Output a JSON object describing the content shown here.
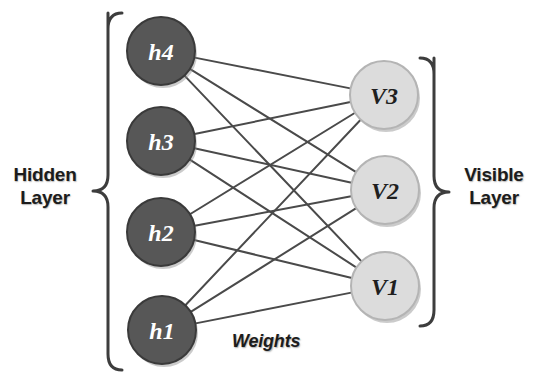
{
  "diagram": {
    "background_color": "#ffffff",
    "edge_color": "#4a4a4a",
    "edge_width": 2,
    "brace_color": "#3d3d3d"
  },
  "labels": {
    "hidden_layer": "Hidden\nLayer",
    "visible_layer": "Visible\nLayer",
    "weights": "Weights"
  },
  "hidden_layer": {
    "name": "Hidden Layer",
    "fill_color": "#575757",
    "stroke_color": "#3a3a3a",
    "text_color": "#ffffff",
    "radius": 34,
    "nodes": [
      {
        "id": "h4",
        "label": "h4",
        "cx": 161,
        "cy": 51
      },
      {
        "id": "h3",
        "label": "h3",
        "cx": 161,
        "cy": 141
      },
      {
        "id": "h2",
        "label": "h2",
        "cx": 161,
        "cy": 232
      },
      {
        "id": "h1",
        "label": "h1",
        "cx": 162,
        "cy": 330
      }
    ]
  },
  "visible_layer": {
    "name": "Visible Layer",
    "fill_color": "#dcdcdc",
    "stroke_color": "#b4b4b4",
    "text_color": "#1f1f1f",
    "radius": 34,
    "nodes": [
      {
        "id": "V3",
        "label": "V3",
        "cx": 384,
        "cy": 95
      },
      {
        "id": "V2",
        "label": "V2",
        "cx": 385,
        "cy": 190
      },
      {
        "id": "V1",
        "label": "V1",
        "cx": 385,
        "cy": 286
      }
    ]
  },
  "connections": {
    "name": "Weights",
    "description": "fully connected between every hidden node and every visible node",
    "edges": [
      {
        "from": "h4",
        "to": "V3"
      },
      {
        "from": "h4",
        "to": "V2"
      },
      {
        "from": "h4",
        "to": "V1"
      },
      {
        "from": "h3",
        "to": "V3"
      },
      {
        "from": "h3",
        "to": "V2"
      },
      {
        "from": "h3",
        "to": "V1"
      },
      {
        "from": "h2",
        "to": "V3"
      },
      {
        "from": "h2",
        "to": "V2"
      },
      {
        "from": "h2",
        "to": "V1"
      },
      {
        "from": "h1",
        "to": "V3"
      },
      {
        "from": "h1",
        "to": "V2"
      },
      {
        "from": "h1",
        "to": "V1"
      }
    ]
  },
  "braces": {
    "hidden": {
      "x_line": 108,
      "x_tip": 93,
      "y_top": 13,
      "y_bottom": 370,
      "y_mid": 191
    },
    "visible": {
      "x_line": 434,
      "x_tip": 449,
      "y_top": 58,
      "y_bottom": 326,
      "y_mid": 192
    }
  }
}
